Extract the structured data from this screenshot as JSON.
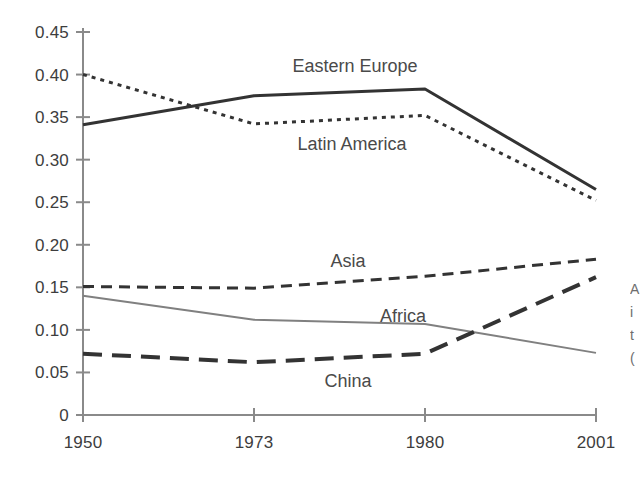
{
  "chart_data": {
    "type": "line",
    "title": "",
    "subtitle": "",
    "xlabel": "",
    "ylabel": "",
    "categories": [
      "1950",
      "1973",
      "1980",
      "2001"
    ],
    "x_tick_labels": [
      "1950",
      "1973",
      "1980",
      "2001"
    ],
    "y_tick_labels": [
      "0.45",
      "0.40",
      "0.35",
      "0.30",
      "0.25",
      "0.20",
      "0.15",
      "0.10",
      "0.05",
      "0"
    ],
    "y_tick_values": [
      0.45,
      0.4,
      0.35,
      0.3,
      0.25,
      0.2,
      0.15,
      0.1,
      0.05,
      0
    ],
    "ylim": [
      0,
      0.45
    ],
    "grid": false,
    "legend_position": "inline-labels",
    "series": [
      {
        "name": "Eastern Europe",
        "values": [
          0.341,
          0.375,
          0.383,
          0.265
        ],
        "style": "solid",
        "color": "#333333",
        "width": 3,
        "label_x": 355,
        "label_y": 72
      },
      {
        "name": "Latin America",
        "values": [
          0.4,
          0.342,
          0.352,
          0.252
        ],
        "style": "dotted",
        "color": "#333333",
        "width": 3,
        "label_x": 352,
        "label_y": 150
      },
      {
        "name": "Asia",
        "values": [
          0.151,
          0.149,
          0.163,
          0.183
        ],
        "style": "dashed",
        "color": "#333333",
        "width": 3,
        "label_x": 348,
        "label_y": 267
      },
      {
        "name": "Africa",
        "values": [
          0.14,
          0.112,
          0.107,
          0.073
        ],
        "style": "thin-solid",
        "color": "#808080",
        "width": 2,
        "label_x": 403,
        "label_y": 322
      },
      {
        "name": "China",
        "values": [
          0.072,
          0.062,
          0.072,
          0.162
        ],
        "style": "long-dash",
        "color": "#333333",
        "width": 4,
        "label_x": 348,
        "label_y": 387
      }
    ]
  },
  "axis": {
    "axis_color": "#8a8a8a",
    "zero_label": "0"
  },
  "side_caption": {
    "line1": "A",
    "line2": "i",
    "line3": "t",
    "line4": "("
  }
}
